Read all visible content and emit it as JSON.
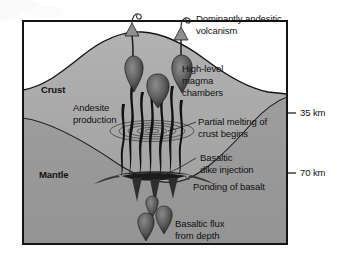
{
  "figure": {
    "type": "geologic-cross-section",
    "region_labels": [
      {
        "id": "crust",
        "text": "Crust"
      },
      {
        "id": "mantle",
        "text": "Mantle"
      }
    ],
    "annotations": [
      {
        "id": "dominant-volcanism",
        "text": "Dominantly andesitic\nvolcanism",
        "line1": "Dominantly andesitic",
        "line2": "volcanism"
      },
      {
        "id": "magma-chambers",
        "text": "High-level\nmagma\nchambers",
        "line1": "High-level",
        "line2": "magma",
        "line3": "chambers"
      },
      {
        "id": "andesite-production",
        "text": "Andesite\nproduction",
        "line1": "Andesite",
        "line2": "production"
      },
      {
        "id": "partial-melting",
        "text": "Partial melting of\ncrust begins",
        "line1": "Partial melting of",
        "line2": "crust begins"
      },
      {
        "id": "dike-injection",
        "text": "Basaltic\ndike injection",
        "line1": "Basaltic",
        "line2": "dike injection"
      },
      {
        "id": "ponding",
        "text": "Ponding of basalt",
        "line1": "Ponding of basalt"
      },
      {
        "id": "basaltic-flux",
        "text": "Basaltic flux\nfrom depth",
        "line1": "Basaltic flux",
        "line2": "from depth"
      }
    ],
    "depth_scale": [
      {
        "id": "depth-35",
        "tick": "–",
        "label": "35 km",
        "full": "– 35 km"
      },
      {
        "id": "depth-70",
        "tick": "–",
        "label": "70 km",
        "full": "– 70 km"
      }
    ],
    "colors": {
      "crust_fill": "#a8a8a8",
      "mantle_fill": "#9a9a9a",
      "magma_dark": "#141414",
      "outline": "#1a1a1a",
      "background": "#ffffff",
      "text": "#111111"
    }
  }
}
